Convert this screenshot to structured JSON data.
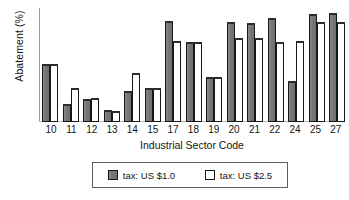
{
  "chart_data": {
    "type": "bar",
    "title": "",
    "subtitle": "",
    "xlabel": "Industrial Sector Code",
    "ylabel": "Abatement (%)",
    "categories": [
      "10",
      "11",
      "12",
      "13",
      "14",
      "15",
      "17",
      "18",
      "19",
      "20",
      "21",
      "22",
      "24",
      "25",
      "27"
    ],
    "series": [
      {
        "name": "tax: US $1.0",
        "color": "#7d7d7d",
        "values": [
          50,
          15,
          19,
          10,
          26,
          29,
          88,
          69,
          39,
          87,
          86,
          90,
          35,
          94,
          95
        ]
      },
      {
        "name": "tax: US $2.5",
        "color": "#ffffff",
        "values": [
          50,
          29,
          20,
          9,
          42,
          29,
          70,
          69,
          39,
          73,
          73,
          69,
          70,
          87,
          87
        ]
      }
    ],
    "ylim": [
      0,
      100
    ],
    "y_ticks_shown": false,
    "grid": false,
    "legend_position": "bottom-center",
    "legend_entries": [
      "tax: US $1.0",
      "tax: US $2.5"
    ],
    "axis_color": "#9a9a9a",
    "bar_edge_color": "#171717"
  },
  "legend": {
    "entry1_label": "tax: US $1.0",
    "entry2_label": "tax: US $2.5"
  }
}
